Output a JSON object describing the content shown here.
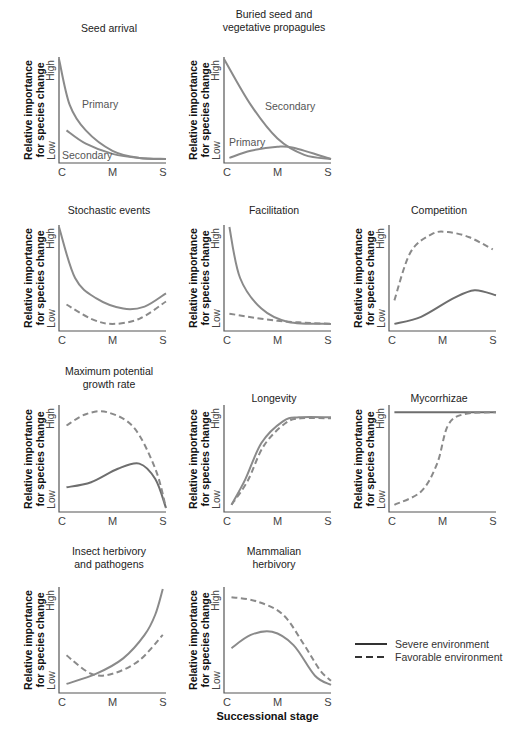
{
  "figure": {
    "ylabel_line1": "Relative importance",
    "ylabel_line2": "for species change",
    "y_high": "High",
    "y_low": "Low",
    "x_ticks": [
      "C",
      "M",
      "S"
    ],
    "xlabel": "Successional stage",
    "legend": [
      {
        "label": "Severe environment",
        "style": "solid"
      },
      {
        "label": "Favorable environment",
        "style": "dashed"
      }
    ],
    "colors": {
      "curve": "#8a8a8a",
      "severe_dark": "#6e6e6e",
      "axis": "#555555",
      "legend_line": "#333333"
    }
  },
  "panels": [
    {
      "title": "Seed arrival",
      "title2": ""
    },
    {
      "title": "Buried seed and",
      "title2": "vegetative propagules"
    },
    {
      "title": "Stochastic events",
      "title2": ""
    },
    {
      "title": "Facilitation",
      "title2": ""
    },
    {
      "title": "Competition",
      "title2": ""
    },
    {
      "title": "Maximum potential",
      "title2": "growth rate"
    },
    {
      "title": "Longevity",
      "title2": ""
    },
    {
      "title": "Mycorrhizae",
      "title2": ""
    },
    {
      "title": "Insect herbivory",
      "title2": "and pathogens"
    },
    {
      "title": "Mammalian",
      "title2": "herbivory"
    }
  ],
  "annotations": {
    "seed_primary": "Primary",
    "seed_secondary": "Secondary",
    "buried_secondary": "Secondary",
    "buried_primary": "Primary"
  },
  "chart_data": [
    {
      "type": "line",
      "title": "Seed arrival",
      "xlabel": "",
      "ylabel": "Relative importance for species change",
      "categories": [
        "C",
        "M",
        "S"
      ],
      "ylim": [
        "Low",
        "High"
      ],
      "series": [
        {
          "name": "Primary",
          "style": "solid",
          "x": [
            0,
            0.1,
            0.25,
            0.5,
            0.75,
            1
          ],
          "y": [
            1.0,
            0.55,
            0.3,
            0.1,
            0.03,
            0.02
          ]
        },
        {
          "name": "Secondary",
          "style": "solid",
          "x": [
            0.07,
            0.25,
            0.5,
            0.75,
            1
          ],
          "y": [
            0.3,
            0.17,
            0.07,
            0.03,
            0.02
          ]
        }
      ]
    },
    {
      "type": "line",
      "title": "Buried seed and vegetative propagules",
      "categories": [
        "C",
        "M",
        "S"
      ],
      "ylim": [
        "Low",
        "High"
      ],
      "series": [
        {
          "name": "Secondary",
          "style": "solid",
          "x": [
            0,
            0.25,
            0.5,
            0.75,
            1
          ],
          "y": [
            1.0,
            0.55,
            0.22,
            0.06,
            0.02
          ]
        },
        {
          "name": "Primary",
          "style": "solid",
          "x": [
            0.05,
            0.25,
            0.5,
            0.65,
            1
          ],
          "y": [
            0.03,
            0.1,
            0.14,
            0.13,
            0.02
          ]
        }
      ]
    },
    {
      "type": "line",
      "title": "Stochastic events",
      "categories": [
        "C",
        "M",
        "S"
      ],
      "ylim": [
        "Low",
        "High"
      ],
      "series": [
        {
          "name": "Severe environment",
          "style": "solid",
          "x": [
            0,
            0.15,
            0.35,
            0.6,
            0.8,
            1
          ],
          "y": [
            1.0,
            0.5,
            0.3,
            0.2,
            0.22,
            0.35
          ]
        },
        {
          "name": "Favorable environment",
          "style": "dashed",
          "x": [
            0.07,
            0.3,
            0.5,
            0.75,
            1
          ],
          "y": [
            0.24,
            0.1,
            0.05,
            0.1,
            0.27
          ]
        }
      ]
    },
    {
      "type": "line",
      "title": "Facilitation",
      "categories": [
        "C",
        "M",
        "S"
      ],
      "ylim": [
        "Low",
        "High"
      ],
      "series": [
        {
          "name": "Severe environment",
          "style": "solid",
          "x": [
            0.05,
            0.15,
            0.35,
            0.6,
            1
          ],
          "y": [
            1.0,
            0.5,
            0.2,
            0.07,
            0.05
          ]
        },
        {
          "name": "Favorable environment",
          "style": "dashed",
          "x": [
            0.05,
            0.5,
            1
          ],
          "y": [
            0.15,
            0.08,
            0.05
          ]
        }
      ]
    },
    {
      "type": "line",
      "title": "Competition",
      "categories": [
        "C",
        "M",
        "S"
      ],
      "ylim": [
        "Low",
        "High"
      ],
      "series": [
        {
          "name": "Severe environment",
          "style": "solid",
          "x": [
            0.05,
            0.3,
            0.6,
            0.8,
            1
          ],
          "y": [
            0.05,
            0.12,
            0.3,
            0.38,
            0.33
          ]
        },
        {
          "name": "Favorable environment",
          "style": "dashed",
          "x": [
            0.05,
            0.2,
            0.4,
            0.55,
            0.75,
            0.97
          ],
          "y": [
            0.28,
            0.75,
            0.93,
            0.95,
            0.9,
            0.78
          ]
        }
      ]
    },
    {
      "type": "line",
      "title": "Maximum potential growth rate",
      "categories": [
        "C",
        "M",
        "S"
      ],
      "ylim": [
        "Low",
        "High"
      ],
      "series": [
        {
          "name": "Severe environment",
          "style": "solid",
          "x": [
            0.07,
            0.3,
            0.55,
            0.75,
            0.9,
            1
          ],
          "y": [
            0.22,
            0.27,
            0.4,
            0.45,
            0.3,
            0.02
          ]
        },
        {
          "name": "Favorable environment",
          "style": "dashed",
          "x": [
            0.07,
            0.25,
            0.45,
            0.7,
            0.9,
            1
          ],
          "y": [
            0.82,
            0.93,
            0.95,
            0.8,
            0.4,
            0.02
          ]
        }
      ]
    },
    {
      "type": "line",
      "title": "Longevity",
      "categories": [
        "C",
        "M",
        "S"
      ],
      "ylim": [
        "Low",
        "High"
      ],
      "series": [
        {
          "name": "Severe environment",
          "style": "solid",
          "x": [
            0.07,
            0.2,
            0.35,
            0.55,
            0.7,
            1
          ],
          "y": [
            0.05,
            0.3,
            0.65,
            0.86,
            0.9,
            0.9
          ]
        },
        {
          "name": "Favorable environment",
          "style": "dashed",
          "x": [
            0.07,
            0.22,
            0.37,
            0.57,
            0.72,
            1
          ],
          "y": [
            0.05,
            0.28,
            0.62,
            0.84,
            0.89,
            0.89
          ]
        }
      ]
    },
    {
      "type": "line",
      "title": "Mycorrhizae",
      "categories": [
        "C",
        "M",
        "S"
      ],
      "ylim": [
        "Low",
        "High"
      ],
      "series": [
        {
          "name": "Severe environment",
          "style": "solid",
          "x": [
            0.05,
            1
          ],
          "y": [
            0.95,
            0.95
          ]
        },
        {
          "name": "Favorable environment",
          "style": "dashed",
          "x": [
            0.05,
            0.3,
            0.45,
            0.55,
            0.7,
            1
          ],
          "y": [
            0.05,
            0.18,
            0.45,
            0.82,
            0.93,
            0.95
          ]
        }
      ]
    },
    {
      "type": "line",
      "title": "Insect herbivory and pathogens",
      "categories": [
        "C",
        "M",
        "S"
      ],
      "ylim": [
        "Low",
        "High"
      ],
      "series": [
        {
          "name": "Severe environment",
          "style": "solid",
          "x": [
            0.07,
            0.35,
            0.6,
            0.8,
            0.9,
            0.97
          ],
          "y": [
            0.07,
            0.17,
            0.32,
            0.55,
            0.75,
            1.0
          ]
        },
        {
          "name": "Favorable environment",
          "style": "dashed",
          "x": [
            0.07,
            0.3,
            0.5,
            0.75,
            0.97
          ],
          "y": [
            0.35,
            0.17,
            0.17,
            0.3,
            0.55
          ]
        }
      ]
    },
    {
      "type": "line",
      "title": "Mammalian herbivory",
      "xlabel": "Successional stage",
      "categories": [
        "C",
        "M",
        "S"
      ],
      "ylim": [
        "Low",
        "High"
      ],
      "series": [
        {
          "name": "Severe environment",
          "style": "solid",
          "x": [
            0.07,
            0.25,
            0.45,
            0.65,
            0.85,
            1
          ],
          "y": [
            0.42,
            0.55,
            0.58,
            0.45,
            0.15,
            0.06
          ]
        },
        {
          "name": "Favorable environment",
          "style": "dashed",
          "x": [
            0.07,
            0.3,
            0.55,
            0.75,
            0.9,
            1
          ],
          "y": [
            0.92,
            0.88,
            0.75,
            0.45,
            0.2,
            0.1
          ]
        }
      ]
    }
  ]
}
